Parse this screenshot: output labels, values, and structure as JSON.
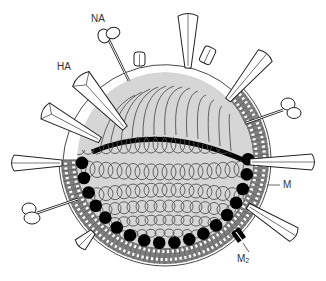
{
  "diagram": {
    "colors": {
      "background": "#ffffff",
      "outline": "#222222",
      "membrane_gray": "#7a7a7a",
      "core_fill": "#d9d9d9",
      "m1_beads": "#000000",
      "spike_fill": "#ffffff"
    },
    "labels": {
      "na": "NA",
      "ha": "HA",
      "m": "M",
      "m2_main": "M",
      "m2_sub": "2"
    },
    "components": [
      {
        "id": "na",
        "name": "neuraminidase spike (mushroom-shaped)",
        "count_visible": 4
      },
      {
        "id": "ha",
        "name": "hemagglutinin spike (club-shaped)",
        "count_visible": 7
      },
      {
        "id": "m",
        "name": "matrix / lipid bilayer membrane"
      },
      {
        "id": "m2",
        "name": "M2 ion channel"
      },
      {
        "id": "m1",
        "name": "black matrix protein bead layer"
      },
      {
        "id": "rnp",
        "name": "coiled ribonucleoprotein core"
      }
    ]
  }
}
